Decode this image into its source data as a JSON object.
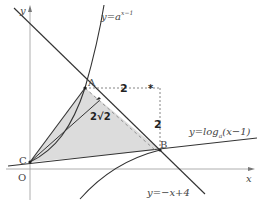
{
  "figure": {
    "axes": {
      "x_label": "x",
      "y_label": "y",
      "origin_label": "O"
    },
    "points": {
      "A": "A",
      "B": "B",
      "C": "C"
    },
    "curves": {
      "exp_label_base": "y=a",
      "exp_label_exp": "x−1",
      "log_label_pre": "y=log",
      "log_label_sub": "a",
      "log_label_post": "(x−1)",
      "line_label": "y=−x+4"
    },
    "annotations": {
      "horizontal_leg": "2",
      "vertical_leg": "2",
      "hypotenuse": "2√2",
      "corner_mark": "*"
    },
    "colors": {
      "stroke": "#333333",
      "axis": "#888888",
      "fill": "#d9d9d9",
      "dashed": "#777777"
    }
  }
}
